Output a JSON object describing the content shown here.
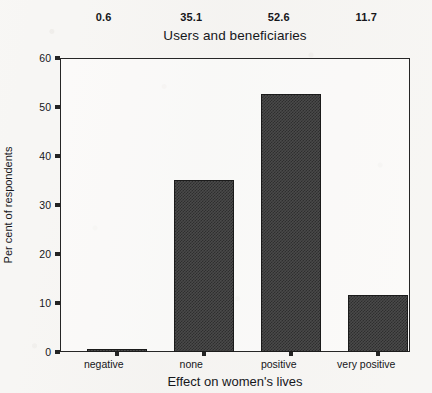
{
  "chart_data": {
    "type": "bar",
    "title": "Users and beneficiaries",
    "xlabel": "Effect on women's lives",
    "ylabel": "Per cent of respondents",
    "categories": [
      "negative",
      "none",
      "positive",
      "very positive"
    ],
    "values": [
      0.6,
      35.1,
      52.6,
      11.7
    ],
    "value_labels": [
      "0.6",
      "35.1",
      "52.6",
      "11.7"
    ],
    "ylim": [
      0,
      60
    ],
    "yticks": [
      0,
      10,
      20,
      30,
      40,
      50,
      60
    ],
    "ytick_labels": [
      "0",
      "10",
      "20",
      "30",
      "40",
      "50",
      "60"
    ],
    "grid": false,
    "legend": null,
    "series": [
      {
        "name": "Users and beneficiaries",
        "values": [
          0.6,
          35.1,
          52.6,
          11.7
        ]
      }
    ],
    "bar_color": "#3a3a3a",
    "bar_edge_color": "#1b1b1b",
    "axis_color": "#262626",
    "background_color": "#f7f6f4"
  }
}
